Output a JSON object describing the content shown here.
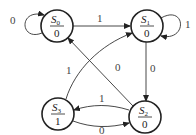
{
  "diagram": {
    "type": "moore-state-machine",
    "states": [
      {
        "id": "S0",
        "name": "S",
        "sub": "0",
        "output": "0",
        "cx": 57,
        "cy": 26
      },
      {
        "id": "S1",
        "name": "S",
        "sub": "1",
        "output": "0",
        "cx": 147,
        "cy": 26
      },
      {
        "id": "S2",
        "name": "S",
        "sub": "2",
        "output": "0",
        "cx": 144,
        "cy": 118
      },
      {
        "id": "S3",
        "name": "S",
        "sub": "3",
        "output": "1",
        "cx": 58,
        "cy": 114
      }
    ],
    "transitions": [
      {
        "from": "S0",
        "to": "S0",
        "label": "0"
      },
      {
        "from": "S0",
        "to": "S1",
        "label": "1"
      },
      {
        "from": "S1",
        "to": "S1",
        "label": "1"
      },
      {
        "from": "S1",
        "to": "S2",
        "label": "0"
      },
      {
        "from": "S2",
        "to": "S0",
        "label": "0"
      },
      {
        "from": "S2",
        "to": "S3",
        "label": "1"
      },
      {
        "from": "S3",
        "to": "S2",
        "label": "0"
      },
      {
        "from": "S3",
        "to": "S1",
        "label": "1"
      }
    ]
  }
}
